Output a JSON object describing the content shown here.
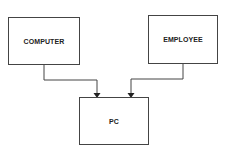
{
  "diagram": {
    "type": "entity-relationship",
    "nodes": [
      {
        "id": "computer",
        "label": "COMPUTER",
        "x": 8,
        "y": 17,
        "w": 72,
        "h": 48
      },
      {
        "id": "employee",
        "label": "EMPLOYEE",
        "x": 148,
        "y": 15,
        "w": 70,
        "h": 49
      },
      {
        "id": "pc",
        "label": "PC",
        "x": 79,
        "y": 97,
        "w": 70,
        "h": 48
      }
    ],
    "edges": [
      {
        "from": "computer",
        "to": "pc",
        "path": "M44,65 L44,80 L97,80 L97,94"
      },
      {
        "from": "employee",
        "to": "pc",
        "path": "M183,64 L183,79 L131,79 L131,94"
      }
    ],
    "colors": {
      "stroke": "#444444",
      "text": "#222222",
      "background": "#ffffff"
    }
  }
}
